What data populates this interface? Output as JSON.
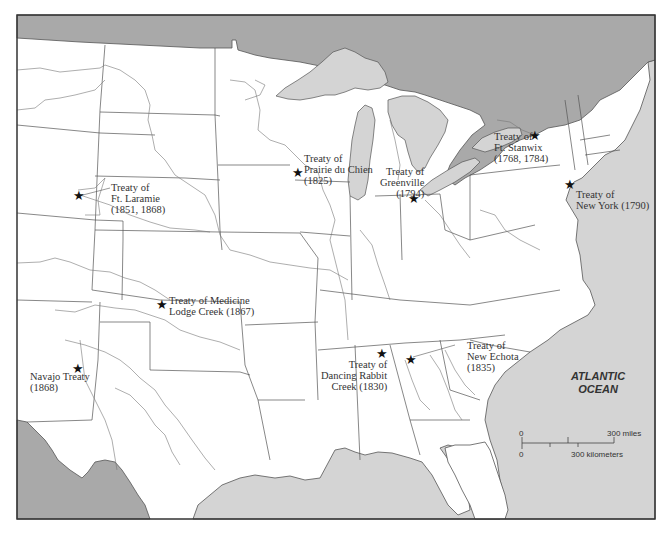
{
  "map": {
    "title": "",
    "colors": {
      "land": "#ffffff",
      "canada": "#a9a9a9",
      "water": "#d4d4d4",
      "border": "#555555",
      "river": "#777777",
      "frame": "#333333"
    },
    "ocean_label": {
      "line1": "ATLANTIC",
      "line2": "OCEAN"
    },
    "scale_bar": {
      "miles_zero": "0",
      "miles_label": "300 miles",
      "km_zero": "0",
      "km_label": "300 kilometers"
    },
    "treaties": [
      {
        "id": "ft-laramie",
        "lines": [
          "Treaty of",
          "Ft. Laramie",
          "(1851, 1868)"
        ]
      },
      {
        "id": "prairie-du-chien",
        "lines": [
          "Treaty of",
          "Prairie du Chien",
          "(1825)"
        ]
      },
      {
        "id": "greenville",
        "lines": [
          "Treaty of",
          "Greenville",
          "(1794)"
        ]
      },
      {
        "id": "ft-stanwix",
        "lines": [
          "Treaty of",
          "Ft. Stanwix",
          "(1768, 1784)"
        ]
      },
      {
        "id": "new-york",
        "lines": [
          "Treaty of",
          "New York (1790)"
        ]
      },
      {
        "id": "medicine-lodge-creek",
        "lines": [
          "Treaty of Medicine",
          "Lodge Creek (1867)"
        ]
      },
      {
        "id": "navajo",
        "lines": [
          "Navajo Treaty",
          "(1868)"
        ]
      },
      {
        "id": "dancing-rabbit-creek",
        "lines": [
          "Treaty of",
          "Dancing Rabbit",
          "Creek (1830)"
        ]
      },
      {
        "id": "new-echota",
        "lines": [
          "Treaty of",
          "New Echota",
          "(1835)"
        ]
      }
    ],
    "star_glyph": "★"
  }
}
